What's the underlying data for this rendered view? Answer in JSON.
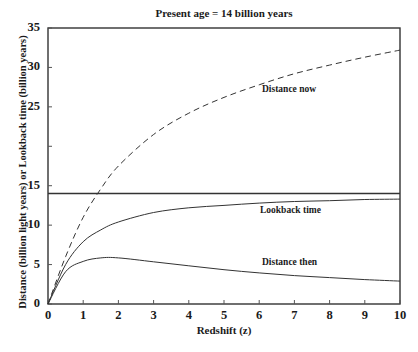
{
  "chart_data": {
    "type": "line",
    "title": "Present age = 14 billion years",
    "xlabel": "Redshift (z)",
    "ylabel": "Distance (billion light years) or Lookback time (billion years)",
    "xlim": [
      0,
      10
    ],
    "ylim": [
      0,
      35
    ],
    "x_ticks": [
      "0",
      "1",
      "2",
      "3",
      "4",
      "5",
      "6",
      "7",
      "8",
      "9",
      "10"
    ],
    "y_ticks": [
      {
        "value": 0,
        "label": "0"
      },
      {
        "value": 5,
        "label": "5"
      },
      {
        "value": 10,
        "label": "10"
      },
      {
        "value": 15,
        "label": "15"
      },
      {
        "value": 20,
        "label": ""
      },
      {
        "value": 25,
        "label": "25"
      },
      {
        "value": 30,
        "label": "30"
      },
      {
        "value": 35,
        "label": "35"
      }
    ],
    "grid": false,
    "legend": "none (inline curve annotations)",
    "x": [
      0,
      0.5,
      1,
      1.5,
      2,
      3,
      4,
      5,
      6,
      7,
      8,
      9,
      10
    ],
    "series": [
      {
        "name": "Distance now",
        "style": "dashed",
        "values": [
          0,
          6.0,
          11.0,
          14.6,
          17.5,
          21.5,
          24.2,
          26.2,
          27.8,
          29.2,
          30.3,
          31.3,
          32.2
        ]
      },
      {
        "name": "Lookback time",
        "style": "solid",
        "values": [
          0,
          5.0,
          7.9,
          9.4,
          10.4,
          11.6,
          12.2,
          12.5,
          12.8,
          13.0,
          13.1,
          13.25,
          13.3
        ]
      },
      {
        "name": "Distance then",
        "style": "solid",
        "values": [
          0,
          4.1,
          5.4,
          5.85,
          5.85,
          5.35,
          4.85,
          4.35,
          3.95,
          3.6,
          3.35,
          3.1,
          2.9
        ]
      },
      {
        "name": "Present age",
        "style": "solid-horizontal",
        "values": [
          14,
          14,
          14,
          14,
          14,
          14,
          14,
          14,
          14,
          14,
          14,
          14,
          14
        ]
      }
    ],
    "annotations": [
      {
        "text": "Distance now",
        "x": 6.2,
        "y": 27.0
      },
      {
        "text": "Lookback time",
        "x": 6.2,
        "y": 11.8
      },
      {
        "text": "Distance then",
        "x": 6.2,
        "y": 5.2
      }
    ]
  },
  "labels": {
    "title": "Present age = 14 billion years",
    "xlabel": "Redshift (z)",
    "ylabel": "Distance (billion light years) or Lookback time (billion years)",
    "distance_now": "Distance now",
    "lookback_time": "Lookback time",
    "distance_then": "Distance then"
  }
}
